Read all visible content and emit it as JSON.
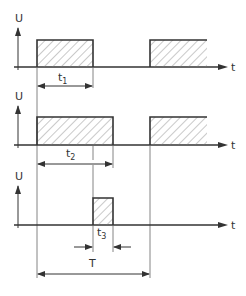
{
  "diagram": {
    "type": "pulse-timing-diagram",
    "colors": {
      "ink": "#333333",
      "thin": "#666666",
      "hatch": "#777777",
      "background": "#ffffff"
    },
    "axis_labels": {
      "y": "U",
      "x": "t"
    },
    "rows": [
      {
        "id": "row1",
        "y_label": "U",
        "x_label": "t",
        "duration_label": "t",
        "duration_sub": "1"
      },
      {
        "id": "row2",
        "y_label": "U",
        "x_label": "t",
        "duration_label": "t",
        "duration_sub": "2"
      },
      {
        "id": "row3",
        "y_label": "U",
        "x_label": "t",
        "duration_label": "t",
        "duration_sub": "3"
      }
    ],
    "period_label": "T"
  }
}
